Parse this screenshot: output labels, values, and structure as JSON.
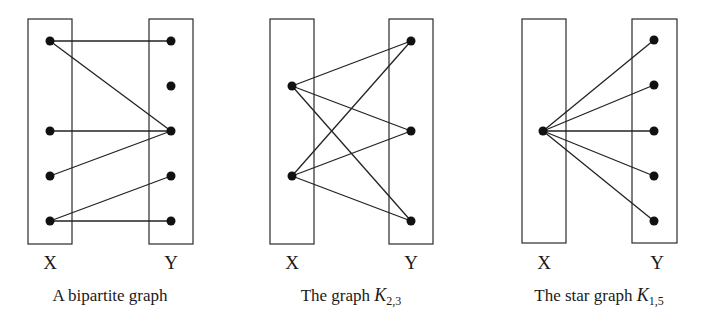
{
  "figure": {
    "colors": {
      "stroke": "#222222",
      "vertex": "#111111",
      "background": "#ffffff"
    },
    "vertex_radius": 4.5,
    "diagrams": [
      {
        "id": "bipartite",
        "caption": {
          "text": "A bipartite graph",
          "symbol": "",
          "subscript": "",
          "x": 110,
          "y": 301
        },
        "parts": [
          {
            "label": "X",
            "box": {
              "x": 28,
              "y": 19,
              "w": 44,
              "h": 225
            },
            "label_pos": {
              "x": 50,
              "y": 269
            },
            "vertices": [
              {
                "id": "x1",
                "x": 50,
                "y": 41
              },
              {
                "id": "x2",
                "x": 50,
                "y": 131
              },
              {
                "id": "x3",
                "x": 50,
                "y": 176
              },
              {
                "id": "x4",
                "x": 50,
                "y": 221
              }
            ]
          },
          {
            "label": "Y",
            "box": {
              "x": 149,
              "y": 19,
              "w": 44,
              "h": 225
            },
            "label_pos": {
              "x": 171,
              "y": 269
            },
            "vertices": [
              {
                "id": "y1",
                "x": 171,
                "y": 41
              },
              {
                "id": "y2",
                "x": 171,
                "y": 86
              },
              {
                "id": "y3",
                "x": 171,
                "y": 131
              },
              {
                "id": "y4",
                "x": 171,
                "y": 176
              },
              {
                "id": "y5",
                "x": 171,
                "y": 221
              }
            ]
          }
        ],
        "edges": [
          [
            "x1",
            "y1"
          ],
          [
            "x1",
            "y3"
          ],
          [
            "x2",
            "y3"
          ],
          [
            "x3",
            "y3"
          ],
          [
            "x4",
            "y4"
          ],
          [
            "x4",
            "y5"
          ]
        ]
      },
      {
        "id": "k23",
        "caption": {
          "text": "The graph ",
          "symbol": "K",
          "subscript": "2,3",
          "x": 351,
          "y": 301
        },
        "parts": [
          {
            "label": "X",
            "box": {
              "x": 270,
              "y": 19,
              "w": 44,
              "h": 225
            },
            "label_pos": {
              "x": 292,
              "y": 269
            },
            "vertices": [
              {
                "id": "x1",
                "x": 292,
                "y": 86
              },
              {
                "id": "x2",
                "x": 292,
                "y": 176
              }
            ]
          },
          {
            "label": "Y",
            "box": {
              "x": 389,
              "y": 19,
              "w": 44,
              "h": 225
            },
            "label_pos": {
              "x": 411,
              "y": 269
            },
            "vertices": [
              {
                "id": "y1",
                "x": 411,
                "y": 41
              },
              {
                "id": "y2",
                "x": 411,
                "y": 131
              },
              {
                "id": "y3",
                "x": 411,
                "y": 221
              }
            ]
          }
        ],
        "edges": [
          [
            "x1",
            "y1"
          ],
          [
            "x1",
            "y2"
          ],
          [
            "x1",
            "y3"
          ],
          [
            "x2",
            "y1"
          ],
          [
            "x2",
            "y2"
          ],
          [
            "x2",
            "y3"
          ]
        ]
      },
      {
        "id": "star15",
        "caption": {
          "text": "The star graph ",
          "symbol": "K",
          "subscript": "1,5",
          "x": 599,
          "y": 301
        },
        "parts": [
          {
            "label": "X",
            "box": {
              "x": 522,
              "y": 19,
              "w": 44,
              "h": 224
            },
            "label_pos": {
              "x": 544,
              "y": 269
            },
            "vertices": [
              {
                "id": "x1",
                "x": 543,
                "y": 131
              }
            ]
          },
          {
            "label": "Y",
            "box": {
              "x": 632,
              "y": 19,
              "w": 45,
              "h": 224
            },
            "label_pos": {
              "x": 657,
              "y": 269
            },
            "vertices": [
              {
                "id": "y1",
                "x": 654,
                "y": 40
              },
              {
                "id": "y2",
                "x": 654,
                "y": 85
              },
              {
                "id": "y3",
                "x": 654,
                "y": 131
              },
              {
                "id": "y4",
                "x": 654,
                "y": 176
              },
              {
                "id": "y5",
                "x": 654,
                "y": 221
              }
            ]
          }
        ],
        "edges": [
          [
            "x1",
            "y1"
          ],
          [
            "x1",
            "y2"
          ],
          [
            "x1",
            "y3"
          ],
          [
            "x1",
            "y4"
          ],
          [
            "x1",
            "y5"
          ]
        ]
      }
    ]
  }
}
